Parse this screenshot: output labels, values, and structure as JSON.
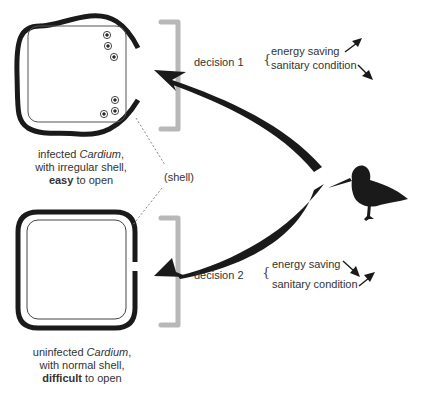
{
  "diagram": {
    "type": "decision-diagram",
    "clams": [
      {
        "id": "infected",
        "caption_line1_prefix": "infected ",
        "caption_line1_italic": "Cardium",
        "caption_line1_suffix": ",",
        "caption_line2": "with irregular shell,",
        "caption_line3_bold": "easy",
        "caption_line3_suffix": " to open",
        "parasite_count": 6
      },
      {
        "id": "uninfected",
        "caption_line1_prefix": "uninfected ",
        "caption_line1_italic": "Cardium",
        "caption_line1_suffix": ",",
        "caption_line2": "with normal shell,",
        "caption_line3_bold": "difficult",
        "caption_line3_suffix": " to open"
      }
    ],
    "shell_label": "(shell)",
    "decisions": [
      {
        "label": "decision 1",
        "brace": "{",
        "factors": [
          {
            "name": "energy saving",
            "direction": "up"
          },
          {
            "name": "sanitary condition",
            "direction": "down"
          }
        ]
      },
      {
        "label": "decision 2",
        "brace": "{",
        "factors": [
          {
            "name": "energy saving",
            "direction": "down"
          },
          {
            "name": "sanitary condition",
            "direction": "up"
          }
        ]
      }
    ],
    "predator": "shorebird (oystercatcher) silhouette",
    "colors": {
      "shell": "#1a1a1a",
      "bracket": "#b8b8b8",
      "arrow": "#1a1a1a",
      "text": "#333333",
      "dotted_line": "#888888"
    }
  }
}
